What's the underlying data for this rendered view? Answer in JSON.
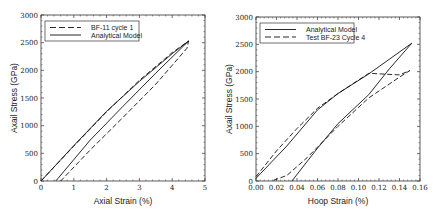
{
  "chart_data": [
    {
      "type": "line",
      "title": "",
      "xlabel": "Axial Strain (%)",
      "ylabel": "Axail Stress (GPa)",
      "xlim": [
        0,
        5
      ],
      "ylim": [
        0,
        3000
      ],
      "xticks": [
        "0",
        "1",
        "2",
        "3",
        "4",
        "5"
      ],
      "yticks": [
        "0",
        "500",
        "1000",
        "1500",
        "2000",
        "2500",
        "3000"
      ],
      "grid": false,
      "legend_position": "upper left",
      "series": [
        {
          "name": "BF-11 cycle 1",
          "style": "dashed",
          "x": [
            0,
            1,
            2,
            3,
            4,
            4.5,
            4.45,
            3.5,
            2.5,
            1.5,
            0.6
          ],
          "y": [
            0,
            630,
            1250,
            1820,
            2320,
            2530,
            2400,
            1750,
            1150,
            560,
            0
          ]
        },
        {
          "name": "Analytical Model",
          "style": "solid",
          "x": [
            0,
            1,
            2,
            3,
            4,
            4.5,
            3.5,
            2.5,
            1.5,
            0.45
          ],
          "y": [
            0,
            640,
            1260,
            1800,
            2300,
            2530,
            1950,
            1350,
            740,
            0
          ]
        }
      ]
    },
    {
      "type": "line",
      "title": "",
      "xlabel": "Hoop Strain (%)",
      "ylabel": "Axail Stress (GPa)",
      "xlim": [
        0,
        0.16
      ],
      "ylim": [
        0,
        3000
      ],
      "xticks": [
        "0.00",
        "0.02",
        "0.04",
        "0.06",
        "0.08",
        "0.10",
        "0.12",
        "0.14",
        "0.16"
      ],
      "yticks": [
        "0",
        "500",
        "1000",
        "1500",
        "2000",
        "2500",
        "3000"
      ],
      "grid": false,
      "legend_position": "upper left",
      "series": [
        {
          "name": "Analytical Model",
          "style": "solid",
          "x": [
            0.0,
            0.03,
            0.06,
            0.08,
            0.11,
            0.152,
            0.13,
            0.11,
            0.08,
            0.06,
            0.035
          ],
          "y": [
            50,
            640,
            1300,
            1600,
            1960,
            2520,
            2050,
            1580,
            1050,
            600,
            0
          ]
        },
        {
          "name": "Test BF-23 Cycle 4",
          "style": "dashed",
          "x": [
            0.0,
            0.02,
            0.04,
            0.06,
            0.08,
            0.11,
            0.14,
            0.15,
            0.14,
            0.11,
            0.08,
            0.05,
            0.03,
            0.015
          ],
          "y": [
            80,
            550,
            960,
            1330,
            1600,
            1970,
            1940,
            2020,
            1900,
            1520,
            1000,
            430,
            100,
            0
          ]
        }
      ]
    }
  ]
}
